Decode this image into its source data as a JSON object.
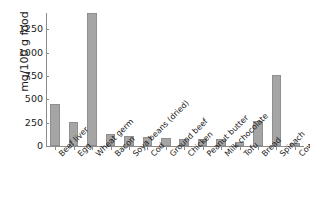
{
  "chart_data": {
    "type": "bar",
    "title": "",
    "xlabel": "",
    "ylabel": "mg/100 g food",
    "ylim": [
      0,
      1425
    ],
    "yticks": [
      0,
      250,
      500,
      750,
      1000,
      1250
    ],
    "ytick_labels": [
      "0",
      "250",
      "500",
      "750",
      "1000",
      "1250"
    ],
    "grid": false,
    "legend": null,
    "bar_color": "#a5a5a5",
    "bar_edge_color": "#8f8f8f",
    "axis_color": "#8c8c8c",
    "categories": [
      "Beef liver",
      "Egg",
      "Wheat germ",
      "Bacon",
      "Soya beans (dried)",
      "Cod",
      "Ground beef",
      "Chicken",
      "Peanut butter",
      "Milk chocolate",
      "Tofu",
      "Bread",
      "Spinach",
      "Cows' milk"
    ],
    "values": [
      450,
      257,
      1425,
      130,
      110,
      95,
      90,
      80,
      75,
      80,
      40,
      270,
      765,
      30
    ]
  }
}
